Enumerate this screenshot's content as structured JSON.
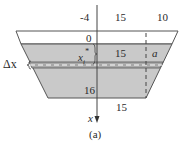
{
  "figure": {
    "caption": "(a)",
    "top_labels": {
      "left": "-4",
      "middle": "15",
      "right": "10"
    },
    "surface_depth_label": "0",
    "strip_depth_label": "x_i*",
    "strip_depth_base": "x",
    "strip_depth_sub": "i",
    "strip_depth_sup": "*",
    "strip_width_label": "15",
    "strip_offset_label": "a",
    "strip_thickness_label": "Δx",
    "bottom_depth_label": "16",
    "bottom_width_label": "15",
    "axis_label": "x",
    "colors": {
      "water_fill": "#c9c9c9",
      "strip_fill": "#a9a9a9",
      "outline": "#555555",
      "axis": "#444444",
      "background": "#ffffff"
    }
  }
}
